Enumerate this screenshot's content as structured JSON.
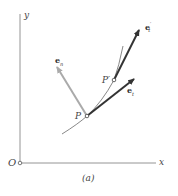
{
  "figure": {
    "caption": "(a)",
    "axes": {
      "x_label": "x",
      "y_label": "y",
      "origin_label": "O"
    },
    "points": [
      {
        "label": "P",
        "x": 87,
        "y": 116
      },
      {
        "label": "P′",
        "x": 114,
        "y": 80
      }
    ],
    "vectors": [
      {
        "label": "e",
        "sub": "n",
        "sup": "",
        "from": "P",
        "color": "#aaaaaa"
      },
      {
        "label": "e",
        "sub": "t",
        "sup": "",
        "from": "P",
        "color": "#333333"
      },
      {
        "label": "e",
        "sub": "t",
        "sup": "′",
        "from": "P′",
        "color": "#333333"
      }
    ]
  }
}
